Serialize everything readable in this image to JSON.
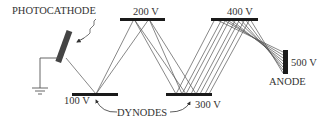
{
  "diagram": {
    "labels": {
      "photocathode": "PHOTOCATHODE",
      "anode": "ANODE",
      "dynodes": "DYNODES"
    },
    "dynodes": [
      {
        "id": "d1",
        "voltage": "100 V"
      },
      {
        "id": "d2",
        "voltage": "200 V"
      },
      {
        "id": "d3",
        "voltage": "300 V"
      },
      {
        "id": "d4",
        "voltage": "400 V"
      }
    ],
    "anode_voltage": "500 V",
    "colors": {
      "line": "#555555",
      "plate": "#1a1a1a",
      "cathode": "#444444"
    }
  }
}
